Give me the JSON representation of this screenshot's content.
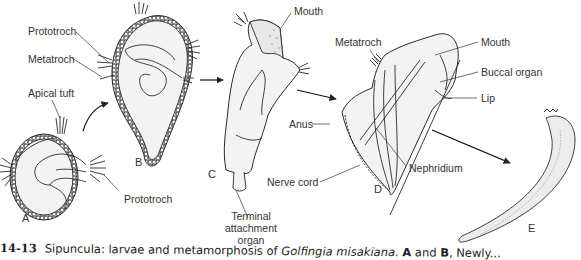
{
  "figure": {
    "number": "14-13",
    "caption_prefix": "Sipuncula: larvae and metamorphosis of",
    "species": "Golfingia misakiana",
    "caption_suffix_a": ". ",
    "caption_bold_a": "A",
    "caption_and": " and ",
    "caption_bold_b": "B",
    "caption_tail": ", Newly..."
  },
  "stages": {
    "A": "A",
    "B": "B",
    "C": "C",
    "D": "D",
    "E": "E"
  },
  "labels": {
    "prototroch_b": "Prototroch",
    "metatroch_b": "Metatroch",
    "apical_tuft": "Apical tuft",
    "prototroch_a": "Prototroch",
    "mouth_c": "Mouth",
    "terminal_line1": "Terminal",
    "terminal_line2": "attachment",
    "terminal_line3": "organ",
    "metatroch_d": "Metatroch",
    "mouth_d": "Mouth",
    "buccal_organ": "Buccal organ",
    "lip": "Lip",
    "anus": "Anus",
    "nephridium": "Nephridium",
    "nerve_cord": "Nerve cord"
  },
  "colors": {
    "ink": "#2a2a2a",
    "fill": "#f2f2f2",
    "background": "#ffffff"
  }
}
